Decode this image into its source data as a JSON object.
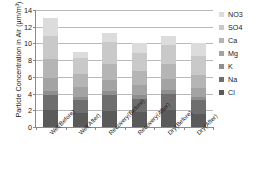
{
  "chart_data": {
    "type": "bar",
    "stacked": true,
    "title": "",
    "xlabel": "",
    "ylabel": "Particle Concentration in Air (µm/m³)",
    "ylim": [
      0,
      14
    ],
    "ytick_values": [
      0,
      2,
      4,
      6,
      8,
      10,
      12,
      14
    ],
    "ytick_labels": [
      "0",
      "2",
      "4",
      "6",
      "8",
      "10",
      "12",
      "14"
    ],
    "grid": "horizontal",
    "legend_position": "right",
    "categories": [
      "Wet(Before)",
      "Wet(After)",
      "Recovery(Before)",
      "Recovery(After)",
      "Dry(Before)",
      "Dry(After)"
    ],
    "series": [
      {
        "name": "Cl",
        "color": "#5a5a5a",
        "values": [
          2.0,
          1.7,
          1.9,
          1.8,
          2.0,
          1.6
        ]
      },
      {
        "name": "Na",
        "color": "#6e6e6e",
        "values": [
          1.8,
          1.5,
          1.9,
          1.6,
          1.9,
          1.6
        ]
      },
      {
        "name": "K",
        "color": "#8f8f8f",
        "values": [
          0.5,
          0.4,
          0.5,
          0.4,
          0.5,
          0.4
        ]
      },
      {
        "name": "Mg",
        "color": "#a3a3a3",
        "values": [
          1.6,
          1.2,
          1.3,
          1.2,
          1.3,
          1.1
        ]
      },
      {
        "name": "Ca",
        "color": "#b5b5b5",
        "values": [
          2.3,
          1.6,
          2.0,
          1.7,
          1.8,
          1.5
        ]
      },
      {
        "name": "SO4",
        "color": "#c9c9c9",
        "values": [
          2.7,
          1.9,
          2.6,
          2.2,
          2.3,
          2.3
        ]
      },
      {
        "name": "NO3",
        "color": "#dcdcdc",
        "values": [
          2.1,
          0.7,
          1.1,
          1.2,
          1.1,
          1.6
        ]
      }
    ],
    "totals": [
      13.0,
      9.0,
      11.3,
      10.1,
      10.9,
      10.1
    ]
  },
  "legend": {
    "items": [
      {
        "label": "NO3",
        "color": "#dcdcdc"
      },
      {
        "label": "SO4",
        "color": "#c9c9c9"
      },
      {
        "label": "Ca",
        "color": "#b5b5b5"
      },
      {
        "label": "Mg",
        "color": "#a3a3a3"
      },
      {
        "label": "K",
        "color": "#8f8f8f"
      },
      {
        "label": "Na",
        "color": "#6e6e6e"
      },
      {
        "label": "Cl",
        "color": "#5a5a5a"
      }
    ]
  },
  "colors": {
    "axis": "#8a8a8a",
    "grid": "#b9b9b9",
    "text": "#1a1a1a",
    "background": "#ffffff"
  }
}
